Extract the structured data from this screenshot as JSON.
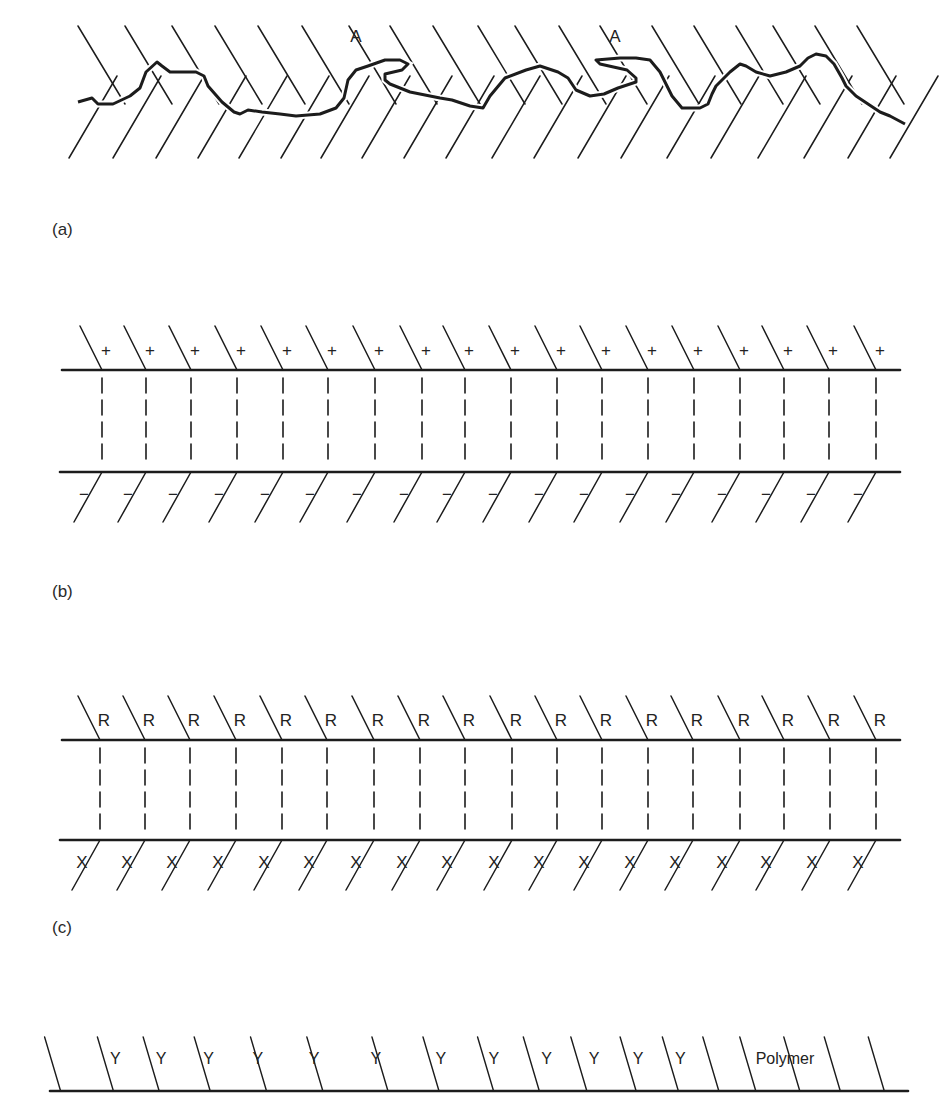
{
  "panels": {
    "a": {
      "label": "(a)",
      "label_pos": [
        52,
        220
      ],
      "description": "Rough interface with mechanical interlocking",
      "annotations": [
        {
          "text": "A",
          "x": 356,
          "y": 42
        },
        {
          "text": "A",
          "x": 615,
          "y": 42
        }
      ],
      "interface_path": "M78,102 L92,98 L98,104 L113,104 L130,96 L140,88 L146,72 L157,62 L162,66 L170,72 L182,72 L196,72 L204,76 L208,86 L222,102 L234,112 L240,114 L248,110 L262,112 L280,114 L296,116 L320,114 L336,108 L344,98 L348,80 L356,70 L368,66 L385,60 L400,60 L408,64 L402,70 L385,74 L385,80 L390,84 L410,92 L440,98 L452,100 L470,106 L483,108 L490,96 L505,78 L526,70 L540,66 L558,72 L568,78 L576,90 L590,96 L604,94 L618,88 L636,82 L636,78 L627,70 L600,64 L596,60 L620,58 L636,58 L650,60 L660,72 L666,84 L672,96 L682,108 L700,108 L708,104 L712,94 L716,86 L730,72 L740,64 L746,66 L756,72 L770,76 L786,72 L800,66 L808,58 L816,54 L826,56 L834,64 L842,78 L846,86 L856,96 L868,104 L880,112 L890,116 L905,124",
      "upper_hatch_x_top": [
        103,
        150,
        197,
        240,
        283,
        327,
        374,
        415,
        458,
        503,
        540,
        584,
        625,
        677,
        719,
        761,
        798,
        840,
        882
      ],
      "lower_hatch_x_bottom": [
        69,
        113,
        156,
        198,
        239,
        281,
        321,
        362,
        404,
        446,
        492,
        534,
        578,
        621,
        667,
        711,
        758,
        804,
        848,
        890
      ]
    },
    "b": {
      "label": "(b)",
      "label_pos": [
        52,
        582
      ],
      "description": "Electrostatic double layer across interface",
      "top_line_y": 370,
      "bottom_line_y": 472,
      "top_symbol": "+",
      "bottom_symbol": "−",
      "columns_x": [
        102,
        146,
        191,
        237,
        283,
        328,
        375,
        422,
        465,
        511,
        557,
        602,
        648,
        694,
        740,
        784,
        829,
        876
      ]
    },
    "c": {
      "label": "(c)",
      "label_pos": [
        52,
        918
      ],
      "description": "Chemical bonding between R and X groups",
      "top_line_y": 740,
      "bottom_line_y": 840,
      "top_symbol": "R",
      "bottom_symbol": "X",
      "columns_x": [
        100,
        145,
        190,
        236,
        282,
        327,
        374,
        420,
        465,
        512,
        557,
        602,
        648,
        693,
        740,
        784,
        830,
        876
      ]
    },
    "d": {
      "description": "Polymer surface with Y groups",
      "line_y": 1091,
      "group_symbol": "Y",
      "group_x": [
        82,
        108,
        135,
        163,
        195,
        230,
        267,
        297,
        327,
        354,
        379,
        403
      ],
      "polymer_label": "Polymer",
      "polymer_label_x": 785,
      "hatch_x_bottom": [
        75,
        102,
        128,
        157,
        189,
        222,
        261,
        293,
        321,
        349,
        375,
        399,
        425,
        448,
        471,
        495,
        519,
        545
      ]
    }
  },
  "colors": {
    "ink": "#1c1c1c",
    "background": "#ffffff"
  }
}
